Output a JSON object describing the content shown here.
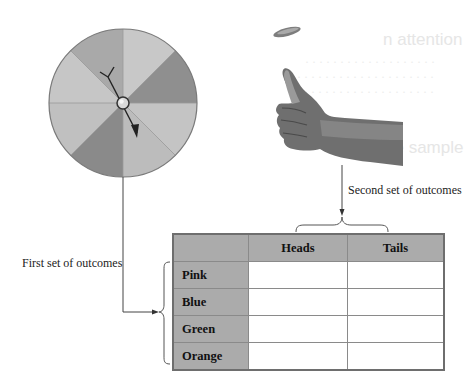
{
  "figure": {
    "spinner": {
      "name": "color spinner",
      "sectors": 8,
      "sector_fills": [
        "#b3b3b3",
        "#c6c6c6",
        "#8f8f8f",
        "#c2c2c2",
        "#b9b9b9",
        "#8a8a8a",
        "#bdbdbd",
        "#c4c4c4"
      ],
      "rim_color": "#7a7a7a"
    },
    "coin_toss": {
      "name": "thumb flipping coin"
    },
    "labels": {
      "first_set": "First set of outcomes",
      "second_set": "Second set of outcomes"
    },
    "table": {
      "columns": [
        "",
        "Heads",
        "Tails"
      ],
      "rows": [
        {
          "label": "Pink",
          "cells": [
            "",
            ""
          ]
        },
        {
          "label": "Blue",
          "cells": [
            "",
            ""
          ]
        },
        {
          "label": "Green",
          "cells": [
            "",
            ""
          ]
        },
        {
          "label": "Orange",
          "cells": [
            "",
            ""
          ]
        }
      ],
      "header_fill": "#ababab"
    }
  }
}
